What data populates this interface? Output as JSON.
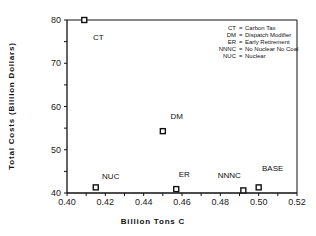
{
  "chart_data": {
    "type": "scatter",
    "title": "",
    "xlabel": "Billion Tons C",
    "ylabel": "Total Costs (Billion Dollars)",
    "xlim": [
      0.4,
      0.52
    ],
    "ylim": [
      40,
      80
    ],
    "xticks": [
      "0.40",
      "0.42",
      "0.44",
      "0.46",
      "0.48",
      "0.50",
      "0.52"
    ],
    "yticks": [
      "40",
      "50",
      "60",
      "70",
      "80"
    ],
    "grid": false,
    "points": [
      {
        "label": "CT",
        "x": 0.409,
        "y": 80.0
      },
      {
        "label": "NUC",
        "x": 0.415,
        "y": 41.3
      },
      {
        "label": "DM",
        "x": 0.45,
        "y": 54.3
      },
      {
        "label": "ER",
        "x": 0.457,
        "y": 40.9
      },
      {
        "label": "NNNC",
        "x": 0.492,
        "y": 40.6
      },
      {
        "label": "BASE",
        "x": 0.5,
        "y": 41.3
      }
    ],
    "legend": [
      {
        "abbr": "CT",
        "text": "CT = Carbon Tax"
      },
      {
        "abbr": "DM",
        "text": "DM = Dispatch Modifier"
      },
      {
        "abbr": "ER",
        "text": "ER = Early Retirement"
      },
      {
        "abbr": "NNNC",
        "text": "NNNC = No Nuclear No Coal"
      },
      {
        "abbr": "NUC",
        "text": "NUC = Nuclear"
      }
    ],
    "legend_position": "upper right"
  }
}
